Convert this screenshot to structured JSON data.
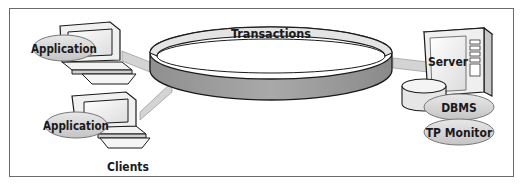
{
  "diagram": {
    "ring_label": "Transactions",
    "clients": {
      "group_label": "Clients",
      "items": [
        {
          "label": "Application"
        },
        {
          "label": "Application"
        }
      ]
    },
    "server": {
      "label": "Server",
      "components": [
        {
          "label": "DBMS"
        },
        {
          "label": "TP Monitor"
        }
      ]
    },
    "colors": {
      "ring_band": "#a0a0a0",
      "ring_top": "#e2e2e2",
      "oval_fill": "#d8d8d8",
      "connector": "#d4d4d4",
      "outline": "#1a1a1a",
      "frame": "#6a6a6a"
    }
  }
}
